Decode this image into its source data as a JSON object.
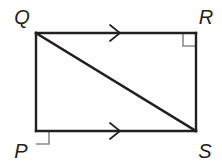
{
  "figure": {
    "name": "quadrilateral-pqrs-with-diagonal",
    "shape_type": "rectangle",
    "background_color": "#ffffff",
    "stroke_color": "#231f20",
    "marker_color": "#8a8a8a",
    "vertices": [
      {
        "id": "Q",
        "label": "Q",
        "x": 36,
        "y": 33,
        "label_x": 22,
        "label_y": 24,
        "right_angle": false
      },
      {
        "id": "R",
        "label": "R",
        "x": 196,
        "y": 33,
        "label_x": 206,
        "label_y": 24,
        "right_angle": true
      },
      {
        "id": "S",
        "label": "S",
        "x": 196,
        "y": 131,
        "label_x": 205,
        "label_y": 158,
        "right_angle": false
      },
      {
        "id": "P",
        "label": "P",
        "x": 36,
        "y": 131,
        "label_x": 21,
        "label_y": 158,
        "right_angle": true
      }
    ],
    "sides": [
      {
        "id": "QR",
        "from": "Q",
        "to": "R",
        "tick_marks": 1,
        "x1": 36,
        "y1": 33,
        "x2": 196,
        "y2": 33
      },
      {
        "id": "RS",
        "from": "R",
        "to": "S",
        "tick_marks": 0,
        "x1": 196,
        "y1": 33,
        "x2": 196,
        "y2": 131
      },
      {
        "id": "PS",
        "from": "P",
        "to": "S",
        "tick_marks": 1,
        "x1": 36,
        "y1": 131,
        "x2": 196,
        "y2": 131
      },
      {
        "id": "PQ",
        "from": "P",
        "to": "Q",
        "tick_marks": 0,
        "x1": 36,
        "y1": 131,
        "x2": 36,
        "y2": 33
      }
    ],
    "diagonal": {
      "id": "QS",
      "from": "Q",
      "to": "S",
      "x1": 36,
      "y1": 33,
      "x2": 196,
      "y2": 131
    },
    "parallel_arrows": [
      {
        "id": "arrow-QR",
        "on_side": "QR",
        "cx": 120,
        "cy": 33,
        "direction": "right"
      },
      {
        "id": "arrow-PS",
        "on_side": "PS",
        "cx": 120,
        "cy": 131,
        "direction": "right"
      }
    ],
    "right_angle_markers": [
      {
        "id": "right-angle-R",
        "at_vertex": "R",
        "x": 183,
        "y": 33,
        "size": 13,
        "inward_x": -1,
        "inward_y": 1
      },
      {
        "id": "right-angle-P",
        "at_vertex": "P",
        "x": 36,
        "y": 118,
        "size": 13,
        "inward_x": 1,
        "inward_y": 1
      }
    ]
  }
}
